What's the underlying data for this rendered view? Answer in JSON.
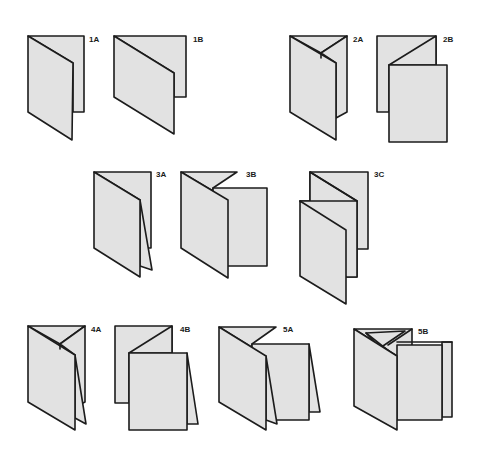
{
  "diagram": {
    "type": "folding-diagram",
    "colors": {
      "paper": "#e2e2e2",
      "stroke": "#1c1c1c",
      "background": "#ffffff"
    },
    "figures": [
      {
        "id": "1A",
        "label": "1A",
        "row": 1,
        "description": "Single fold, vertical (4-page folder, tall)"
      },
      {
        "id": "1B",
        "label": "1B",
        "row": 1,
        "description": "Single fold, short/wide panel"
      },
      {
        "id": "2A",
        "label": "2A",
        "row": 1,
        "description": "Two parallel folds, letter/wrap fold"
      },
      {
        "id": "2B",
        "label": "2B",
        "row": 1,
        "description": "Two parallel folds, accordion"
      },
      {
        "id": "3A",
        "label": "3A",
        "row": 2,
        "description": "Three panel, inner short fold"
      },
      {
        "id": "3B",
        "label": "3B",
        "row": 2,
        "description": "Three parallel folds, gate/wrap"
      },
      {
        "id": "3C",
        "label": "3C",
        "row": 2,
        "description": "Three parallel folds, accordion"
      },
      {
        "id": "4A",
        "label": "4A",
        "row": 3,
        "description": "Wrap fold with inner folded panel"
      },
      {
        "id": "4B",
        "label": "4B",
        "row": 3,
        "description": "Accordion with inner folded flap"
      },
      {
        "id": "5A",
        "label": "5A",
        "row": 3,
        "description": "Multi-panel wrap + accordion"
      },
      {
        "id": "5B",
        "label": "5B",
        "row": 3,
        "description": "Multi-panel combination fold"
      }
    ]
  }
}
